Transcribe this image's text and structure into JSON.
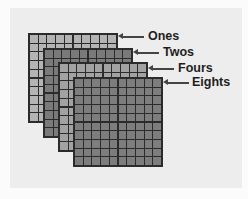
{
  "diagram": {
    "grid_size": 10,
    "layers": [
      {
        "name": "Ones",
        "label": "Ones",
        "cell_color": "#b4b4b4"
      },
      {
        "name": "Twos",
        "label": "Twos",
        "cell_color": "#7a7a7a"
      },
      {
        "name": "Fours",
        "label": "Fours",
        "cell_color": "#a2a2a2"
      },
      {
        "name": "Eights",
        "label": "Eights",
        "cell_color": "#7d7d7d"
      }
    ],
    "colors": {
      "background": "#ededed",
      "grid_line": "#2b2b2b",
      "text": "#1e1e1e",
      "arrow": "#444444"
    }
  }
}
